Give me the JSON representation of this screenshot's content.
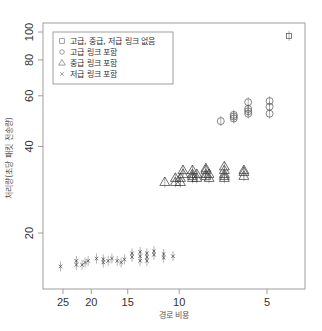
{
  "chart_data": {
    "type": "scatter",
    "title": "",
    "xlabel": "경로 비용",
    "ylabel": "처리량(초당 패킷 전송량)",
    "x_scale": "log, reversed",
    "y_scale": "log",
    "x_ticks": [
      "25",
      "20",
      "15",
      "10",
      "5"
    ],
    "y_ticks": [
      "20",
      "40",
      "60",
      "80",
      "100"
    ],
    "xlim": [
      28,
      3.8
    ],
    "ylim": [
      14.5,
      108
    ],
    "grid": false,
    "legend_position": "top-left",
    "legend": [
      {
        "label": "고급, 중급, 저급 링크 없음",
        "marker": "square"
      },
      {
        "label": "고급 링크 포함",
        "marker": "circle"
      },
      {
        "label": "중급 링크 포함",
        "marker": "triangle"
      },
      {
        "label": "저급 링크 포함",
        "marker": "x"
      }
    ],
    "series": [
      {
        "name": "고급, 중급, 저급 링크 없음",
        "marker": "square",
        "points": [
          [
            4.2,
            97
          ]
        ]
      },
      {
        "name": "고급 링크 포함",
        "marker": "circle",
        "points": [
          [
            7.2,
            49
          ],
          [
            6.5,
            50
          ],
          [
            6.5,
            50.8
          ],
          [
            6.5,
            51.5
          ],
          [
            5.8,
            52
          ],
          [
            5.8,
            53
          ],
          [
            5.8,
            54
          ],
          [
            5.8,
            57
          ],
          [
            4.9,
            52
          ],
          [
            4.9,
            55
          ],
          [
            4.9,
            57.5
          ]
        ]
      },
      {
        "name": "중급 링크 포함",
        "marker": "triangle",
        "points": [
          [
            11.2,
            30
          ],
          [
            10.3,
            30
          ],
          [
            10.3,
            31
          ],
          [
            9.9,
            30
          ],
          [
            9.9,
            31
          ],
          [
            9.7,
            32
          ],
          [
            9.7,
            33
          ],
          [
            9.0,
            31
          ],
          [
            9.0,
            31.5
          ],
          [
            9.0,
            32
          ],
          [
            9.0,
            33
          ],
          [
            8.7,
            31
          ],
          [
            8.7,
            32
          ],
          [
            8.1,
            31.5
          ],
          [
            8.1,
            32
          ],
          [
            8.1,
            33
          ],
          [
            8.1,
            33.5
          ],
          [
            7.9,
            31
          ],
          [
            7.9,
            32
          ],
          [
            7.0,
            31
          ],
          [
            7.0,
            31.5
          ],
          [
            7.0,
            32
          ],
          [
            7.0,
            33
          ],
          [
            7.0,
            34
          ],
          [
            6.0,
            31.5
          ],
          [
            6.0,
            32.5
          ],
          [
            6.0,
            33
          ]
        ]
      },
      {
        "name": "저급 링크 포함",
        "marker": "x",
        "points": [
          [
            25.5,
            15.3
          ],
          [
            22.5,
            15.5
          ],
          [
            22.5,
            16
          ],
          [
            21.5,
            15.5
          ],
          [
            21.0,
            15.8
          ],
          [
            20.5,
            16
          ],
          [
            19.2,
            16.3
          ],
          [
            18.2,
            15.8
          ],
          [
            18.2,
            16.2
          ],
          [
            17.5,
            16
          ],
          [
            17.0,
            16.3
          ],
          [
            16.3,
            16
          ],
          [
            15.8,
            15.8
          ],
          [
            15.4,
            16.2
          ],
          [
            14.5,
            16.5
          ],
          [
            14.5,
            17
          ],
          [
            13.6,
            16
          ],
          [
            13.6,
            16.6
          ],
          [
            13.6,
            17.2
          ],
          [
            12.9,
            16
          ],
          [
            12.9,
            16.5
          ],
          [
            12.9,
            17
          ],
          [
            12.2,
            16.8
          ],
          [
            12.2,
            17.3
          ],
          [
            11.3,
            16.4
          ],
          [
            11.3,
            16.9
          ],
          [
            10.5,
            16.6
          ]
        ]
      }
    ]
  },
  "axes": {
    "xlabel": "경로 비용",
    "ylabel": "처리량(초당 패킷 전송량)"
  }
}
